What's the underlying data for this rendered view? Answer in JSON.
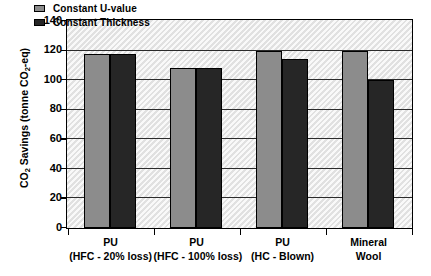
{
  "chart_data": {
    "type": "bar",
    "title": "",
    "xlabel": "",
    "ylabel": "CO2 Savings (tonne CO2-eq)",
    "ylabel_parts": {
      "prefix": "CO",
      "sub1": "2",
      "middle": " Savings (tonne CO",
      "sub2": "2",
      "suffix": "-eq)"
    },
    "categories": [
      {
        "line1": "PU",
        "line2": "(HFC - 20% loss)"
      },
      {
        "line1": "PU",
        "line2": "(HFC - 100% loss)"
      },
      {
        "line1": "PU",
        "line2": "(HC - Blown)"
      },
      {
        "line1": "Mineral",
        "line2": "Wool"
      }
    ],
    "series": [
      {
        "name": "Constant U-value",
        "color": "#8c8c8c",
        "values": [
          118,
          108,
          120,
          120
        ]
      },
      {
        "name": "Constant Thickness",
        "color": "#262626",
        "values": [
          118,
          108,
          114,
          100
        ]
      }
    ],
    "ylim": [
      0,
      140
    ],
    "yticks": [
      0,
      20,
      40,
      60,
      80,
      100,
      120,
      140
    ],
    "ytick_labels": [
      "0",
      "20",
      "40",
      "60",
      "80",
      "100",
      "120",
      "140"
    ],
    "grid": true,
    "grid_axis": "y",
    "legend_position": "top-left-inside",
    "plot_background": "hatched-light-gray"
  },
  "legend": {
    "items": [
      {
        "label": "Constant U-value"
      },
      {
        "label": "Constant Thickness"
      }
    ]
  }
}
